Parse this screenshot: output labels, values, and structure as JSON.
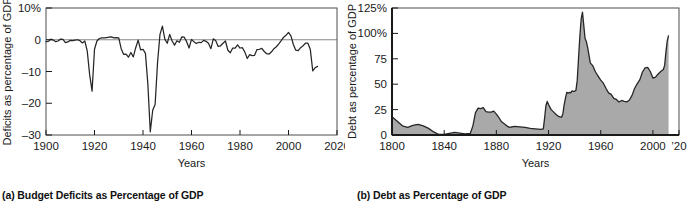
{
  "figure": {
    "panels": [
      {
        "id": "a",
        "caption": "(a)  Budget Deficits as Percentage of GDP"
      },
      {
        "id": "b",
        "caption": "(b)  Debt as Percentage of GDP"
      }
    ]
  },
  "colors": {
    "line": "#262626",
    "fill": "#a9a9a9",
    "frame": "#4d4d4d",
    "zero_line": "#888888",
    "text": "#1a1a1a",
    "background": "#ffffff"
  },
  "chart_data": [
    {
      "type": "line",
      "panel": "a",
      "title": "(a)  Budget Deficits as Percentage of GDP",
      "xlabel": "Years",
      "ylabel": "Deficits as percentage of GDP",
      "xlim": [
        1900,
        2020
      ],
      "ylim": [
        -30,
        10
      ],
      "xticks": [
        1900,
        1920,
        1940,
        1960,
        1980,
        2000,
        2020
      ],
      "xticklabels": [
        "1900",
        "1920",
        "1940",
        "1960",
        "1980",
        "2000",
        "2020"
      ],
      "yticks": [
        10,
        0,
        -10,
        -20,
        -30
      ],
      "yticklabels": [
        "10%",
        "0",
        "–10",
        "–20",
        "–30"
      ],
      "grid": false,
      "legend": null,
      "zero_reference_line": 0,
      "x": [
        1900,
        1901,
        1902,
        1903,
        1904,
        1905,
        1906,
        1907,
        1908,
        1909,
        1910,
        1911,
        1912,
        1913,
        1914,
        1915,
        1916,
        1917,
        1918,
        1919,
        1920,
        1921,
        1922,
        1923,
        1924,
        1925,
        1926,
        1927,
        1928,
        1929,
        1930,
        1931,
        1932,
        1933,
        1934,
        1935,
        1936,
        1937,
        1938,
        1939,
        1940,
        1941,
        1942,
        1943,
        1944,
        1945,
        1946,
        1947,
        1948,
        1949,
        1950,
        1951,
        1952,
        1953,
        1954,
        1955,
        1956,
        1957,
        1958,
        1959,
        1960,
        1961,
        1962,
        1963,
        1964,
        1965,
        1966,
        1967,
        1968,
        1969,
        1970,
        1971,
        1972,
        1973,
        1974,
        1975,
        1976,
        1977,
        1978,
        1979,
        1980,
        1981,
        1982,
        1983,
        1984,
        1985,
        1986,
        1987,
        1988,
        1989,
        1990,
        1991,
        1992,
        1993,
        1994,
        1995,
        1996,
        1997,
        1998,
        1999,
        2000,
        2001,
        2002,
        2003,
        2004,
        2005,
        2006,
        2007,
        2008,
        2009,
        2010,
        2011,
        2012
      ],
      "y": [
        -0.6,
        -0.5,
        0.2,
        -0.1,
        -0.6,
        -0.4,
        0.2,
        0.1,
        -0.9,
        -0.7,
        -0.2,
        -0.3,
        -0.1,
        0.0,
        -0.3,
        -1.0,
        -0.4,
        -3.5,
        -11.0,
        -16.2,
        -3.0,
        -0.4,
        0.4,
        0.6,
        0.6,
        0.7,
        0.8,
        0.9,
        0.6,
        0.7,
        0.6,
        -2.8,
        -4.6,
        -4.5,
        -5.5,
        -4.0,
        -5.4,
        -2.5,
        -0.1,
        -3.2,
        -3.0,
        -4.3,
        -13.9,
        -29.0,
        -22.2,
        -20.4,
        -7.2,
        1.7,
        4.3,
        0.2,
        -1.1,
        1.7,
        -0.4,
        -1.7,
        -0.3,
        -0.8,
        0.9,
        0.8,
        -0.6,
        -2.6,
        0.1,
        -0.6,
        -1.2,
        -0.8,
        -0.9,
        -0.2,
        -0.5,
        -1.1,
        -2.8,
        0.3,
        -0.3,
        -2.1,
        -1.9,
        -1.1,
        -0.4,
        -3.3,
        -4.1,
        -2.6,
        -2.6,
        -1.6,
        -2.6,
        -2.5,
        -3.9,
        -5.9,
        -4.7,
        -5.0,
        -4.9,
        -3.1,
        -3.0,
        -2.7,
        -3.7,
        -4.4,
        -4.5,
        -3.8,
        -2.8,
        -2.2,
        -1.3,
        -0.3,
        0.8,
        1.4,
        2.3,
        1.2,
        -1.5,
        -3.3,
        -3.4,
        -2.5,
        -1.9,
        -1.1,
        -1.1,
        -3.1,
        -9.8,
        -8.8,
        -8.4,
        -9.3
      ]
    },
    {
      "type": "area",
      "panel": "b",
      "title": "(b)  Debt as Percentage of GDP",
      "xlabel": "Years",
      "ylabel": "Debt as percentage of GDP",
      "xlim": [
        1800,
        2020
      ],
      "ylim": [
        0,
        125
      ],
      "xticks": [
        1800,
        1840,
        1880,
        1920,
        1960,
        2000,
        2020
      ],
      "xticklabels": [
        "1800",
        "1840",
        "1880",
        "1920",
        "1960",
        "2000",
        "’20"
      ],
      "yticks": [
        125,
        100,
        75,
        50,
        25,
        0
      ],
      "yticklabels": [
        "125%",
        "100%",
        "75",
        "50",
        "25",
        "0"
      ],
      "grid": false,
      "legend": null,
      "x": [
        1800,
        1804,
        1808,
        1812,
        1816,
        1820,
        1824,
        1828,
        1832,
        1836,
        1840,
        1844,
        1848,
        1852,
        1856,
        1860,
        1862,
        1864,
        1866,
        1868,
        1870,
        1872,
        1874,
        1876,
        1878,
        1880,
        1882,
        1884,
        1886,
        1888,
        1890,
        1894,
        1898,
        1902,
        1906,
        1910,
        1914,
        1916,
        1917,
        1918,
        1919,
        1920,
        1922,
        1924,
        1926,
        1928,
        1930,
        1931,
        1932,
        1933,
        1934,
        1935,
        1936,
        1937,
        1938,
        1939,
        1940,
        1941,
        1942,
        1943,
        1944,
        1945,
        1946,
        1947,
        1948,
        1949,
        1950,
        1952,
        1954,
        1956,
        1958,
        1960,
        1962,
        1964,
        1966,
        1968,
        1970,
        1972,
        1974,
        1976,
        1978,
        1980,
        1982,
        1984,
        1986,
        1988,
        1990,
        1992,
        1994,
        1996,
        1998,
        2000,
        2002,
        2004,
        2006,
        2008,
        2009,
        2010,
        2011,
        2012
      ],
      "y": [
        18.0,
        13.5,
        9.0,
        7.5,
        9.5,
        10.5,
        9.0,
        6.5,
        3.0,
        0.5,
        0.6,
        1.5,
        2.5,
        1.8,
        1.2,
        1.5,
        9.0,
        22.0,
        26.5,
        26.0,
        27.0,
        23.0,
        22.5,
        22.5,
        23.5,
        20.5,
        17.0,
        13.0,
        11.0,
        9.0,
        7.5,
        8.5,
        8.0,
        7.5,
        6.5,
        6.0,
        5.5,
        6.0,
        17.0,
        29.0,
        33.0,
        30.0,
        25.0,
        22.5,
        20.0,
        18.0,
        17.5,
        21.0,
        30.0,
        36.5,
        42.0,
        41.0,
        42.0,
        41.5,
        43.5,
        43.0,
        43.0,
        44.0,
        54.0,
        76.0,
        97.0,
        114.0,
        121.0,
        108.0,
        95.0,
        92.0,
        86.0,
        71.0,
        68.0,
        62.0,
        58.0,
        54.0,
        51.0,
        46.0,
        41.5,
        40.0,
        36.0,
        35.0,
        32.5,
        34.0,
        33.0,
        32.5,
        34.5,
        39.0,
        46.0,
        50.5,
        54.5,
        62.0,
        66.0,
        66.5,
        62.5,
        56.0,
        57.0,
        60.0,
        62.5,
        64.5,
        68.5,
        82.0,
        92.5,
        98.0,
        104.0
      ]
    }
  ]
}
